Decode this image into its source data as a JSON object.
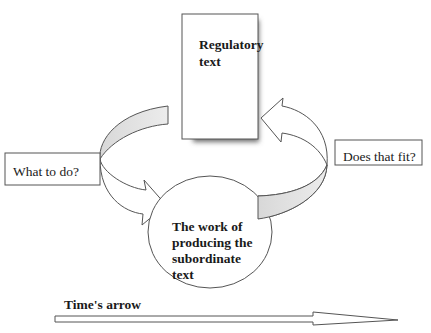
{
  "diagram": {
    "regulatory_box": {
      "label_line1": "Regulatory",
      "label_line2": "text",
      "icon": "document-icon"
    },
    "work_ellipse": {
      "label_line1": "The work of",
      "label_line2": "producing the",
      "label_line3": "subordinate",
      "label_line4": "text"
    },
    "left_label": "What to do?",
    "right_label": "Does that fit?",
    "time_arrow": {
      "label": "Time's arrow",
      "direction": "left-to-right"
    },
    "arrows": [
      {
        "from": "regulatory_box",
        "to": "work_ellipse",
        "via": "What to do?",
        "side": "left"
      },
      {
        "from": "work_ellipse",
        "to": "regulatory_box",
        "via": "Does that fit?",
        "side": "right"
      }
    ],
    "colors": {
      "stroke": "#555555",
      "band_fill": "#e2e2e2",
      "shadow": "#6e6e6e",
      "background": "#ffffff"
    }
  }
}
